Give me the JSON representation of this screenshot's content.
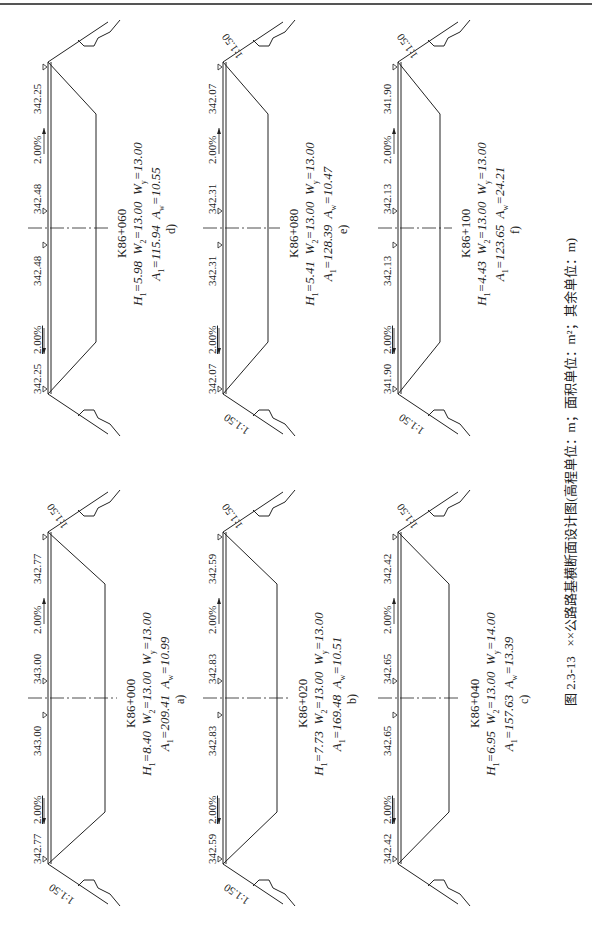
{
  "header": {
    "running_title": ""
  },
  "figure": {
    "caption_number": "图 2.3-13",
    "caption_text": "××公路路基横断面设计图(高程单位：m；面积单位：m²；其余单位：m)"
  },
  "sections": [
    {
      "tag": "a)",
      "station": "K86+000",
      "H1": "8.40",
      "W2": "13.00",
      "Wy": "13.00",
      "A1": "209.41",
      "Aw": "10.99",
      "left_edge": "342.77",
      "left_center": "343.00",
      "right_center": "343.00",
      "right_edge": "342.77",
      "left_slope": "2.00%",
      "right_slope": "2.00%",
      "left_ratio": "1:1.50",
      "right_ratio": "1:1.50"
    },
    {
      "tag": "b)",
      "station": "K86+020",
      "H1": "7.73",
      "W2": "13.00",
      "Wy": "13.00",
      "A1": "169.48",
      "Aw": "10.51",
      "left_edge": "342.59",
      "left_center": "342.83",
      "right_center": "342.83",
      "right_edge": "342.59",
      "left_slope": "2.00%",
      "right_slope": "2.00%",
      "left_ratio": "1:1.50",
      "right_ratio": "1:1.50"
    },
    {
      "tag": "c)",
      "station": "K86+040",
      "H1": "6.95",
      "W2": "13.00",
      "Wy": "14.00",
      "A1": "157.63",
      "Aw": "13.39",
      "left_edge": "342.42",
      "left_center": "342.65",
      "right_center": "342.65",
      "right_edge": "342.42",
      "left_slope": "2.00%",
      "right_slope": "2.00%",
      "left_ratio": "",
      "right_ratio": "1:1.50"
    },
    {
      "tag": "d)",
      "station": "K86+060",
      "H1": "5.98",
      "W2": "13.00",
      "Wy": "13.00",
      "A1": "115.94",
      "Aw": "10.55",
      "left_edge": "342.25",
      "left_center": "342.48",
      "right_center": "342.48",
      "right_edge": "342.25",
      "left_slope": "2.00%",
      "right_slope": "2.00%",
      "left_ratio": "",
      "right_ratio": ""
    },
    {
      "tag": "e)",
      "station": "K86+080",
      "H1": "5.41",
      "W2": "13.00",
      "Wy": "13.00",
      "A1": "128.39",
      "Aw": "10.47",
      "left_edge": "342.07",
      "left_center": "342.31",
      "right_center": "342.31",
      "right_edge": "342.07",
      "left_slope": "2.00%",
      "right_slope": "2.00%",
      "left_ratio": "1:1.50",
      "right_ratio": "1:1.50"
    },
    {
      "tag": "f)",
      "station": "K86+100",
      "H1": "4.43",
      "W2": "13.00",
      "Wy": "13.00",
      "A1": "123.65",
      "Aw": "24.21",
      "left_edge": "341.90",
      "left_center": "342.13",
      "right_center": "342.13",
      "right_edge": "341.90",
      "left_slope": "2.00%",
      "right_slope": "2.00%",
      "left_ratio": "1:1.50",
      "right_ratio": "1:1.50"
    }
  ],
  "labels": {
    "H1": "H",
    "W2": "W",
    "Wy": "W",
    "A1": "A",
    "Aw": "A",
    "sub1": "1",
    "sub2": "2",
    "suby": "y",
    "subw": "w",
    "eq": "="
  }
}
